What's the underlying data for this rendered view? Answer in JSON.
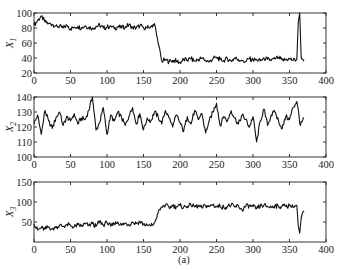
{
  "caption": "(a)",
  "chart_data": [
    {
      "type": "line",
      "ylabel": "X1",
      "ylabel_main": "X",
      "ylabel_sub": "1",
      "xlim": [
        0,
        400
      ],
      "ylim": [
        20,
        100
      ],
      "xticks": [
        0,
        50,
        100,
        150,
        200,
        250,
        300,
        350,
        400
      ],
      "yticks": [
        20,
        40,
        60,
        80,
        100
      ],
      "x": [
        0,
        5,
        10,
        15,
        20,
        25,
        30,
        35,
        40,
        45,
        50,
        55,
        60,
        65,
        70,
        75,
        80,
        85,
        90,
        95,
        100,
        105,
        110,
        115,
        120,
        125,
        130,
        135,
        140,
        145,
        150,
        155,
        160,
        165,
        170,
        175,
        180,
        185,
        190,
        195,
        200,
        205,
        210,
        215,
        220,
        225,
        230,
        235,
        240,
        245,
        250,
        255,
        260,
        265,
        270,
        275,
        280,
        285,
        290,
        295,
        300,
        305,
        310,
        315,
        320,
        325,
        330,
        335,
        340,
        345,
        350,
        355,
        360,
        362,
        364,
        366,
        368,
        370
      ],
      "values": [
        84,
        90,
        96,
        88,
        86,
        85,
        83,
        82,
        80,
        84,
        79,
        81,
        82,
        80,
        83,
        81,
        80,
        82,
        84,
        80,
        81,
        83,
        79,
        82,
        80,
        82,
        84,
        81,
        80,
        83,
        81,
        80,
        82,
        86,
        60,
        36,
        38,
        35,
        37,
        36,
        34,
        38,
        37,
        39,
        36,
        38,
        40,
        37,
        35,
        39,
        41,
        38,
        37,
        39,
        36,
        40,
        38,
        37,
        35,
        39,
        37,
        38,
        36,
        40,
        38,
        37,
        39,
        41,
        37,
        38,
        39,
        37,
        38,
        88,
        100,
        40,
        38,
        36
      ]
    },
    {
      "type": "line",
      "ylabel": "X2",
      "ylabel_main": "X",
      "ylabel_sub": "2",
      "xlim": [
        0,
        400
      ],
      "ylim": [
        100,
        140
      ],
      "xticks": [
        0,
        50,
        100,
        150,
        200,
        250,
        300,
        350,
        400
      ],
      "yticks": [
        100,
        110,
        120,
        130,
        140
      ],
      "x": [
        0,
        5,
        10,
        15,
        20,
        25,
        30,
        35,
        40,
        45,
        50,
        55,
        60,
        65,
        70,
        75,
        80,
        85,
        90,
        95,
        100,
        105,
        110,
        115,
        120,
        125,
        130,
        135,
        140,
        145,
        150,
        155,
        160,
        165,
        170,
        175,
        180,
        185,
        190,
        195,
        200,
        205,
        210,
        215,
        220,
        225,
        230,
        235,
        240,
        245,
        250,
        255,
        260,
        265,
        270,
        275,
        280,
        285,
        290,
        295,
        300,
        305,
        310,
        315,
        320,
        325,
        330,
        335,
        340,
        345,
        350,
        355,
        360,
        365,
        370
      ],
      "values": [
        122,
        128,
        115,
        131,
        124,
        119,
        126,
        130,
        121,
        127,
        124,
        129,
        122,
        126,
        125,
        131,
        140,
        118,
        123,
        133,
        115,
        128,
        124,
        130,
        126,
        121,
        127,
        133,
        122,
        129,
        118,
        126,
        124,
        130,
        127,
        122,
        131,
        126,
        120,
        128,
        123,
        117,
        127,
        122,
        131,
        125,
        129,
        116,
        124,
        130,
        136,
        121,
        127,
        124,
        131,
        126,
        122,
        128,
        125,
        120,
        127,
        110,
        124,
        132,
        121,
        128,
        130,
        124,
        119,
        127,
        125,
        133,
        137,
        121,
        126
      ]
    },
    {
      "type": "line",
      "ylabel": "X3",
      "ylabel_main": "X",
      "ylabel_sub": "3",
      "xlim": [
        0,
        400
      ],
      "ylim": [
        0,
        150
      ],
      "xticks": [
        0,
        50,
        100,
        150,
        200,
        250,
        300,
        350,
        400
      ],
      "yticks": [
        50,
        100,
        150
      ],
      "x": [
        0,
        5,
        10,
        15,
        20,
        25,
        30,
        35,
        40,
        45,
        50,
        55,
        60,
        65,
        70,
        75,
        80,
        85,
        90,
        95,
        100,
        105,
        110,
        115,
        120,
        125,
        130,
        135,
        140,
        145,
        150,
        155,
        160,
        165,
        170,
        175,
        180,
        185,
        190,
        195,
        200,
        205,
        210,
        215,
        220,
        225,
        230,
        235,
        240,
        245,
        250,
        255,
        260,
        265,
        270,
        275,
        280,
        285,
        290,
        295,
        300,
        305,
        310,
        315,
        320,
        325,
        330,
        335,
        340,
        345,
        350,
        355,
        360,
        362,
        364,
        366,
        368,
        370
      ],
      "values": [
        45,
        30,
        35,
        32,
        38,
        33,
        36,
        42,
        39,
        44,
        41,
        38,
        43,
        40,
        45,
        42,
        46,
        39,
        52,
        43,
        48,
        40,
        45,
        50,
        42,
        47,
        44,
        49,
        46,
        51,
        45,
        42,
        40,
        48,
        72,
        88,
        92,
        86,
        90,
        88,
        91,
        87,
        89,
        92,
        88,
        90,
        86,
        91,
        89,
        93,
        88,
        90,
        87,
        89,
        92,
        88,
        90,
        80,
        89,
        91,
        88,
        84,
        90,
        92,
        89,
        87,
        91,
        88,
        90,
        89,
        91,
        87,
        92,
        40,
        22,
        60,
        74,
        78
      ]
    }
  ]
}
